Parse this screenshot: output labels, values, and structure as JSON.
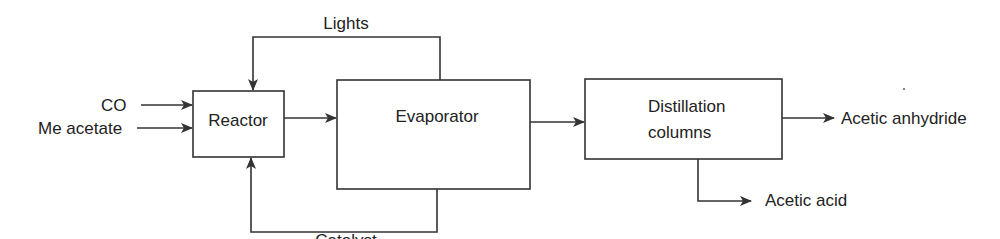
{
  "diagram": {
    "inputs": {
      "co": "CO",
      "me_acetate": "Me acetate"
    },
    "units": {
      "reactor": "Reactor",
      "evaporator": "Evaporator",
      "distillation_line1": "Distillation",
      "distillation_line2": "columns"
    },
    "streams": {
      "lights": "Lights",
      "catalyst": "Catalyst"
    },
    "outputs": {
      "acetic_anhydride": "Acetic anhydride",
      "acetic_acid": "Acetic acid"
    },
    "colors": {
      "line": "#333333",
      "text": "#222222"
    }
  }
}
